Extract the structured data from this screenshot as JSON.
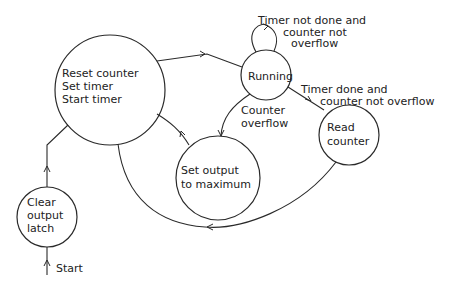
{
  "diagram": {
    "type": "state-machine",
    "states": [
      {
        "id": "reset",
        "lines": [
          "Reset counter",
          "Set timer",
          "Start timer"
        ]
      },
      {
        "id": "running",
        "lines": [
          "Running"
        ]
      },
      {
        "id": "read",
        "lines": [
          "Read",
          "counter"
        ]
      },
      {
        "id": "setmax",
        "lines": [
          "Set output",
          "to maximum"
        ]
      },
      {
        "id": "clear",
        "lines": [
          "Clear",
          "output",
          "latch"
        ]
      }
    ],
    "transitions": [
      {
        "from": "start",
        "to": "clear",
        "label": "Start"
      },
      {
        "from": "clear",
        "to": "reset",
        "label": ""
      },
      {
        "from": "reset",
        "to": "running",
        "label": ""
      },
      {
        "from": "running",
        "to": "running",
        "label_lines": [
          "Timer not done and",
          "counter not",
          "overflow"
        ]
      },
      {
        "from": "running",
        "to": "read",
        "label_lines": [
          "Timer done and",
          "counter not overflow"
        ]
      },
      {
        "from": "running",
        "to": "setmax",
        "label_lines": [
          "Counter",
          "overflow"
        ]
      },
      {
        "from": "setmax",
        "to": "reset",
        "label": ""
      },
      {
        "from": "read",
        "to": "reset",
        "label": ""
      }
    ]
  }
}
